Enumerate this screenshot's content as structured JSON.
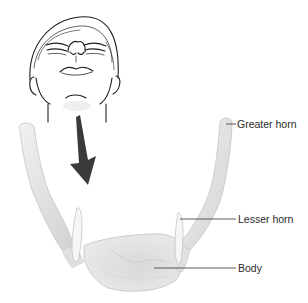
{
  "figure": {
    "labels": [
      {
        "id": "greater_horn",
        "text": "Greater horn"
      },
      {
        "id": "lesser_horn",
        "text": "Lesser horn"
      },
      {
        "id": "body",
        "text": "Body"
      }
    ],
    "icons": {
      "head": "head-tilted-back-icon",
      "arrow": "down-arrow-icon"
    },
    "colors": {
      "bone_fill": "#e6e6e6",
      "bone_shade": "#cfcfcf",
      "bone_outline": "#bdbdbd",
      "arrow": "#3a3a3a",
      "line_art": "#1e1e1e",
      "leader_line": "#333333"
    }
  }
}
